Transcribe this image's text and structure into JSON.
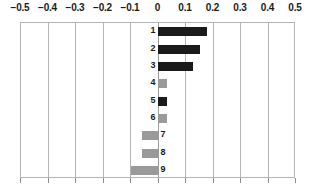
{
  "chart_data": {
    "type": "bar",
    "orientation": "horizontal",
    "title": "",
    "xlabel": "",
    "ylabel": "",
    "xlim": [
      -0.5,
      0.5
    ],
    "xticks": [
      -0.5,
      -0.4,
      -0.3,
      -0.2,
      -0.1,
      0,
      0.1,
      0.2,
      0.3,
      0.4,
      0.5
    ],
    "xticklabels": [
      "−0.5",
      "−0.4",
      "−0.3",
      "−0.2",
      "−0.1",
      "0",
      "0.1",
      "0.2",
      "0.3",
      "0.4",
      "0.5"
    ],
    "grid": true,
    "grid_axis": "x",
    "legend": false,
    "categories": [
      "1",
      "2",
      "3",
      "4",
      "5",
      "6",
      "7",
      "8",
      "9"
    ],
    "values": [
      0.18,
      0.155,
      0.13,
      0.035,
      0.035,
      0.035,
      -0.055,
      -0.055,
      -0.095
    ],
    "colors": [
      "#1a1a1a",
      "#1a1a1a",
      "#1a1a1a",
      "#9a9a9a",
      "#1a1a1a",
      "#9a9a9a",
      "#9a9a9a",
      "#9a9a9a",
      "#9a9a9a"
    ],
    "bars": [
      {
        "label": "1",
        "value": 0.18,
        "color": "#1a1a1a"
      },
      {
        "label": "2",
        "value": 0.155,
        "color": "#1a1a1a"
      },
      {
        "label": "3",
        "value": 0.13,
        "color": "#1a1a1a"
      },
      {
        "label": "4",
        "value": 0.035,
        "color": "#9a9a9a"
      },
      {
        "label": "5",
        "value": 0.035,
        "color": "#1a1a1a"
      },
      {
        "label": "6",
        "value": 0.035,
        "color": "#9a9a9a"
      },
      {
        "label": "7",
        "value": -0.055,
        "color": "#9a9a9a"
      },
      {
        "label": "8",
        "value": -0.055,
        "color": "#9a9a9a"
      },
      {
        "label": "9",
        "value": -0.095,
        "color": "#9a9a9a"
      }
    ],
    "axis_color": "#b5b5b5",
    "background": "#ffffff"
  }
}
